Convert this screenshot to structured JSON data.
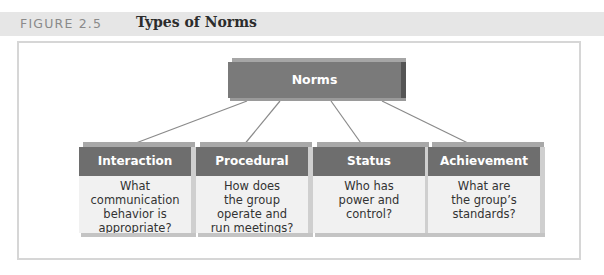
{
  "figure": {
    "label": "FIGURE 2.5",
    "title": "Types of Norms"
  },
  "diagram": {
    "root": {
      "label": "Norms"
    },
    "children": [
      {
        "label": "Interaction",
        "lines": [
          "What",
          "communication",
          "behavior is",
          "appropriate?"
        ]
      },
      {
        "label": "Procedural",
        "lines": [
          "How does",
          "the group",
          "operate and",
          "run meetings?"
        ]
      },
      {
        "label": "Status",
        "lines": [
          "Who has",
          "power and",
          "control?"
        ]
      },
      {
        "label": "Achievement",
        "lines": [
          "What are",
          "the group’s",
          "standards?"
        ]
      }
    ]
  },
  "colors": {
    "header_bg": "#e6e6e6",
    "box_header": "#6e6e6e",
    "box_body": "#f1f1f1",
    "frame_border": "#d6d6d6"
  }
}
